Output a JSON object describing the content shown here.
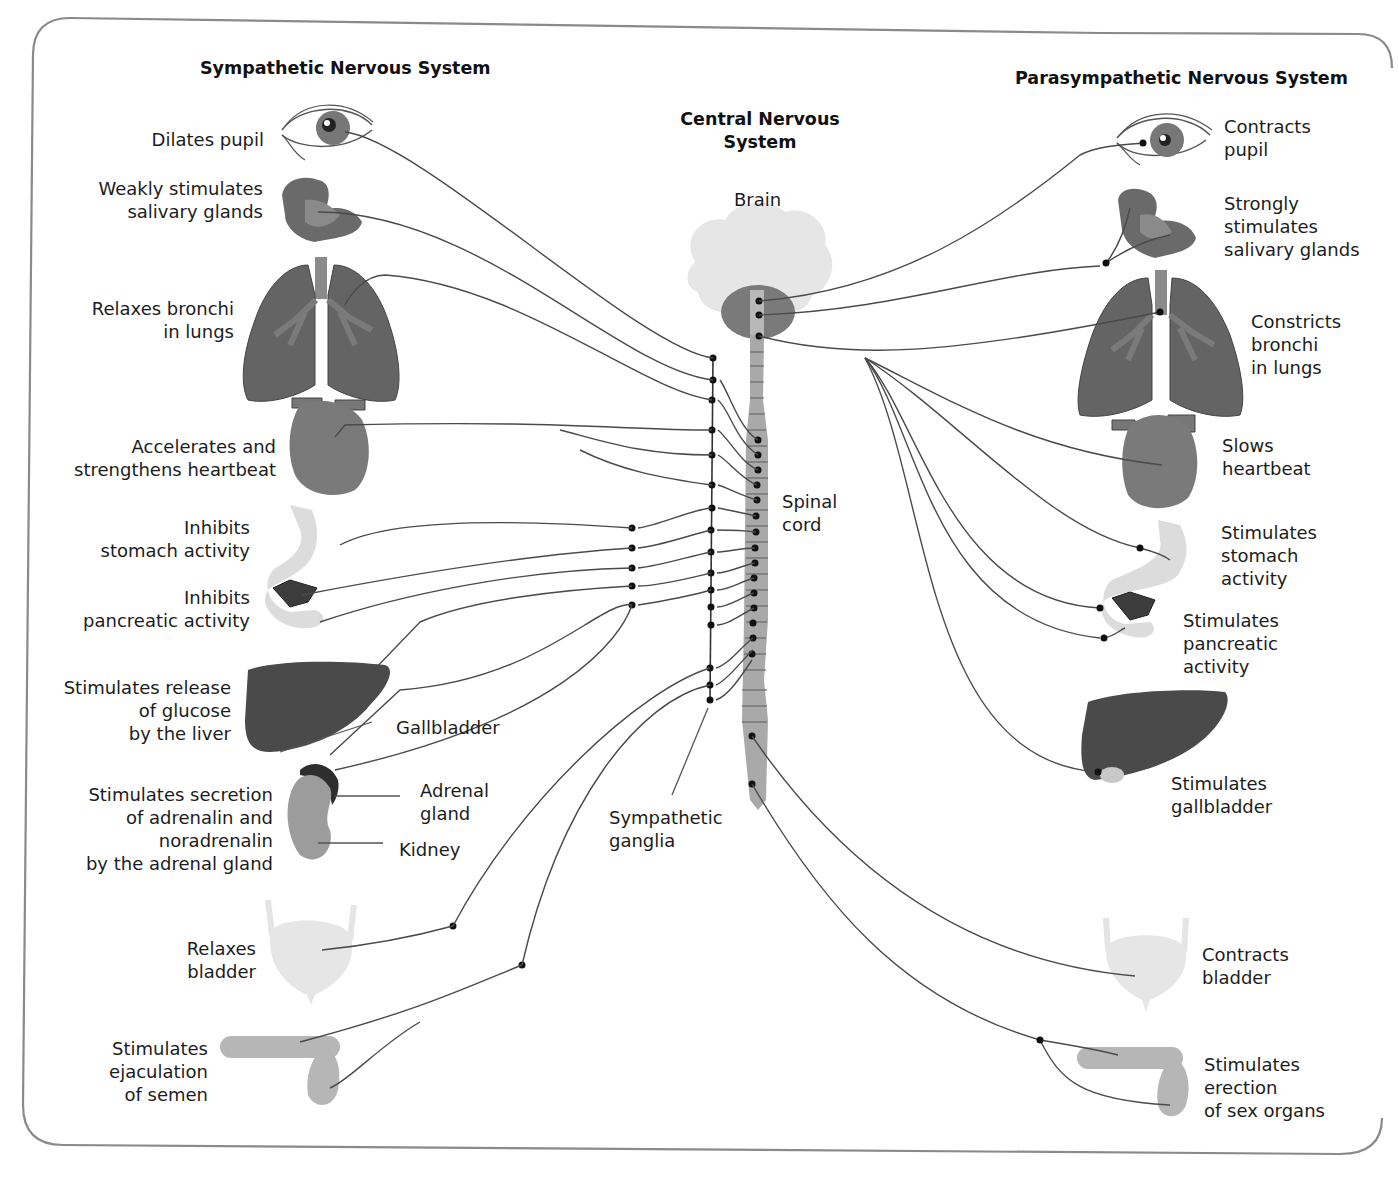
{
  "headers": {
    "sympathetic": "Sympathetic Nervous System",
    "parasympathetic": "Parasympathetic Nervous System",
    "central": "Central Nervous\nSystem"
  },
  "central_labels": {
    "brain": "Brain",
    "spinal_cord": "Spinal\ncord",
    "sympathetic_ganglia": "Sympathetic\nganglia"
  },
  "sympathetic_effects": [
    {
      "organ": "eye",
      "text": "Dilates pupil"
    },
    {
      "organ": "salivary-glands",
      "text": "Weakly stimulates\nsalivary glands"
    },
    {
      "organ": "lungs",
      "text": "Relaxes bronchi\nin lungs"
    },
    {
      "organ": "heart",
      "text": "Accelerates and\nstrengthens heartbeat"
    },
    {
      "organ": "stomach",
      "text": "Inhibits\nstomach activity"
    },
    {
      "organ": "pancreas",
      "text": "Inhibits\npancreatic activity"
    },
    {
      "organ": "liver",
      "text": "Stimulates release\nof glucose\nby the liver"
    },
    {
      "organ": "adrenal-gland",
      "text": "Stimulates secretion\nof adrenalin and\nnoradrenalin\nby the adrenal gland"
    },
    {
      "organ": "bladder",
      "text": "Relaxes\nbladder"
    },
    {
      "organ": "sex-organs",
      "text": "Stimulates\nejaculation\nof semen"
    }
  ],
  "organ_labels": {
    "gallbladder": "Gallbladder",
    "adrenal_gland": "Adrenal\ngland",
    "kidney": "Kidney"
  },
  "parasympathetic_effects": [
    {
      "organ": "eye",
      "text": "Contracts\npupil"
    },
    {
      "organ": "salivary-glands",
      "text": "Strongly\nstimulates\nsalivary glands"
    },
    {
      "organ": "lungs",
      "text": "Constricts\nbronchi\nin lungs"
    },
    {
      "organ": "heart",
      "text": "Slows\nheartbeat"
    },
    {
      "organ": "stomach",
      "text": "Stimulates\nstomach\nactivity"
    },
    {
      "organ": "pancreas",
      "text": "Stimulates\npancreatic\nactivity"
    },
    {
      "organ": "gallbladder",
      "text": "Stimulates\ngallbladder"
    },
    {
      "organ": "bladder",
      "text": "Contracts\nbladder"
    },
    {
      "organ": "sex-organs",
      "text": "Stimulates\nerection\nof sex organs"
    }
  ],
  "colors": {
    "frame": "#8a8a8a",
    "nerve": "#4a4a4a",
    "organ_dark": "#5e5e5e",
    "organ_mid": "#8c8c8c",
    "organ_light": "#d8d8d8",
    "liver": "#4a4a4a",
    "brain": "#e6e6e6",
    "spinal_cord": "#a9a9a9"
  }
}
